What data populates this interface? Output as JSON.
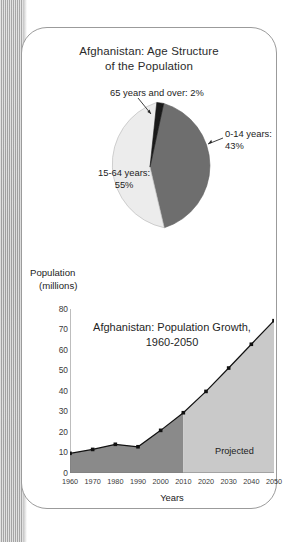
{
  "figure": {
    "left_band": "paper-edge-texture"
  },
  "pie_panel": {
    "title_line1": "Afghanistan: Age Structure",
    "title_line2": "of the Population",
    "callouts": {
      "elderly": "65 years and over: 2%",
      "children_line1": "0-14 years:",
      "children_line2": "43%",
      "working_line1": "15-64 years:",
      "working_line2": "55%"
    }
  },
  "line_panel": {
    "y_axis_label_line1": "Population",
    "y_axis_label_line2": "(millions)",
    "x_axis_title": "Years",
    "title_line1": "Afghanistan: Population Growth,",
    "title_line2": "1960-2050",
    "projected_label": "Projected"
  },
  "colors": {
    "slice_children": "#6e6e6e",
    "slice_working": "#ececec",
    "slice_elderly": "#1a1a1a",
    "area_historical": "#8a8a8a",
    "area_projected": "#c9c9c9",
    "line": "#111111",
    "card_border": "#9b9b9b",
    "band": "#b9b9b9"
  },
  "chart_data": [
    {
      "type": "pie",
      "title": "Afghanistan: Age Structure of the Population",
      "labels": [
        "0-14 years",
        "15-64 years",
        "65 years and over"
      ],
      "values": [
        43,
        55,
        2
      ],
      "value_unit": "percent",
      "annotations": [
        "0-14 years: 43%",
        "15-64 years: 55%",
        "65 years and over: 2%"
      ],
      "legend": "none",
      "colors": [
        "#6e6e6e",
        "#ececec",
        "#1a1a1a"
      ],
      "start_angle_deg": 0,
      "direction": "clockwise"
    },
    {
      "type": "area",
      "title": "Afghanistan: Population Growth, 1960-2050",
      "xlabel": "Years",
      "ylabel": "Population (millions)",
      "x": [
        1960,
        1970,
        1980,
        1990,
        2000,
        2010,
        2020,
        2030,
        2040,
        2050
      ],
      "xtick_labels": [
        "1960",
        "1970",
        "1980",
        "1990",
        "2000",
        "2010",
        "2020",
        "2030",
        "2040",
        "2050"
      ],
      "xlim": [
        1960,
        2050
      ],
      "ylim": [
        0,
        80
      ],
      "ytick_labels": [
        "0",
        "10",
        "20",
        "30",
        "40",
        "50",
        "60",
        "70",
        "80"
      ],
      "ytick_values": [
        0,
        10,
        20,
        30,
        40,
        50,
        60,
        70,
        80
      ],
      "grid": false,
      "markers": true,
      "series": [
        {
          "name": "Population (millions)",
          "values": [
            9.6,
            11.5,
            14.0,
            12.8,
            20.8,
            29.4,
            39.8,
            51.2,
            62.8,
            74.3
          ]
        }
      ],
      "regions": [
        {
          "name": "historical",
          "x_start": 1960,
          "x_end": 2010,
          "color": "#8a8a8a"
        },
        {
          "name": "projected",
          "x_start": 2010,
          "x_end": 2050,
          "color": "#c9c9c9",
          "label": "Projected"
        }
      ]
    }
  ]
}
